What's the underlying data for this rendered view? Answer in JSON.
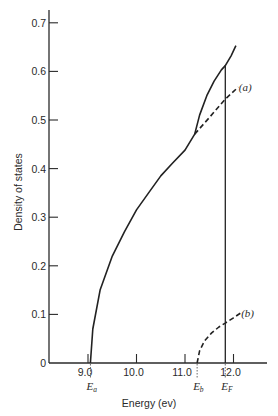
{
  "chart_data": {
    "type": "line",
    "title": "",
    "xlabel": "Energy (ev)",
    "ylabel": "Density of states",
    "xlim": [
      8.2,
      12.65
    ],
    "ylim": [
      0,
      0.72
    ],
    "grid": false,
    "x_ticks": [
      "9.0",
      "10.0",
      "11.0",
      "12.0"
    ],
    "y_ticks": [
      "0",
      "0.1",
      "0.2",
      "0.3",
      "0.4",
      "0.5",
      "0.6",
      "0.7"
    ],
    "markers": [
      {
        "name": "E_a",
        "symbol": "E",
        "subscript": "a",
        "x": 9.05
      },
      {
        "name": "E_b",
        "symbol": "E",
        "subscript": "b",
        "x": 11.25
      },
      {
        "name": "E_F",
        "symbol": "E",
        "subscript": "F",
        "x": 11.83
      }
    ],
    "series": [
      {
        "name": "total",
        "style": "solid",
        "x": [
          9.05,
          9.1,
          9.25,
          9.5,
          9.75,
          10.0,
          10.25,
          10.5,
          10.75,
          11.0,
          11.2,
          11.3,
          11.45,
          11.6,
          11.75,
          11.83,
          11.95,
          12.05
        ],
        "y": [
          0.0,
          0.07,
          0.15,
          0.22,
          0.27,
          0.315,
          0.35,
          0.385,
          0.412,
          0.438,
          0.471,
          0.51,
          0.55,
          0.58,
          0.603,
          0.612,
          0.632,
          0.653
        ]
      },
      {
        "name": "(a)",
        "style": "dashed",
        "x": [
          11.2,
          11.5,
          11.83,
          12.1
        ],
        "y": [
          0.471,
          0.505,
          0.543,
          0.568
        ]
      },
      {
        "name": "(b)",
        "style": "dashed",
        "x": [
          11.25,
          11.3,
          11.4,
          11.55,
          11.7,
          11.83,
          12.0,
          12.15
        ],
        "y": [
          0.0,
          0.025,
          0.045,
          0.062,
          0.074,
          0.082,
          0.093,
          0.103
        ]
      },
      {
        "name": "E_F cutoff",
        "style": "solid-vertical",
        "x": [
          11.83,
          11.83
        ],
        "y": [
          0.0,
          0.612
        ]
      }
    ],
    "annotations": [
      {
        "text": "(a)",
        "x": 12.15,
        "y": 0.568
      },
      {
        "text": "(b)",
        "x": 12.2,
        "y": 0.103
      }
    ]
  }
}
